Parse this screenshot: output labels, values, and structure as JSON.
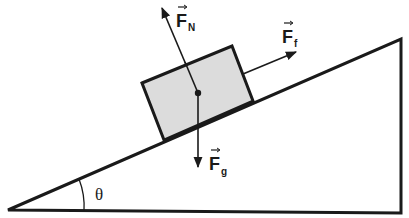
{
  "diagram": {
    "colors": {
      "stroke": "#1a1a1a",
      "block_fill": "#dcdcdc",
      "background": "#ffffff"
    },
    "forces": [
      {
        "id": "normal",
        "symbol": "F",
        "subscript": "N",
        "direction": "perpendicular to incline, up-left"
      },
      {
        "id": "friction",
        "symbol": "F",
        "subscript": "f",
        "direction": "parallel to incline, up-right"
      },
      {
        "id": "gravity",
        "symbol": "F",
        "subscript": "g",
        "direction": "straight down"
      }
    ],
    "angle_label": "θ",
    "labels": {
      "fn_main": "F",
      "fn_sub": "N",
      "ff_main": "F",
      "ff_sub": "f",
      "fg_main": "F",
      "fg_sub": "g",
      "theta": "θ"
    }
  }
}
